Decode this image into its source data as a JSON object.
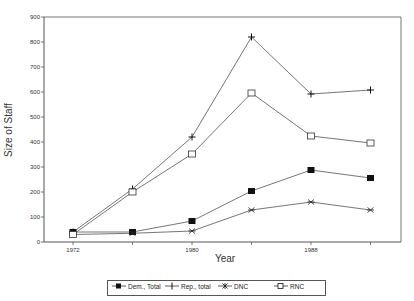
{
  "chart_data": {
    "type": "line",
    "title": "",
    "xlabel": "Year",
    "ylabel": "Size of Staff",
    "x": [
      1972,
      1976,
      1980,
      1984,
      1988,
      1992
    ],
    "x_tick_labels": [
      "1972",
      "",
      "1980",
      "",
      "1988",
      ""
    ],
    "y_ticks": [
      0,
      100,
      200,
      300,
      400,
      500,
      600,
      700,
      800,
      900
    ],
    "ylim": [
      0,
      900
    ],
    "grid": false,
    "legend_position": "bottom",
    "series": [
      {
        "name": "Dem., Total",
        "marker": "filled-square",
        "values": [
          40,
          40,
          84,
          204,
          288,
          256
        ]
      },
      {
        "name": "Rep., total",
        "marker": "plus",
        "values": [
          40,
          212,
          420,
          820,
          592,
          608
        ]
      },
      {
        "name": "DNC",
        "marker": "asterisk",
        "values": [
          30,
          35,
          44,
          128,
          160,
          128
        ]
      },
      {
        "name": "RNC",
        "marker": "open-square",
        "values": [
          30,
          200,
          352,
          596,
          424,
          396
        ]
      }
    ]
  },
  "legend": {
    "items": [
      {
        "label": "Dem., Total"
      },
      {
        "label": "Rep., total"
      },
      {
        "label": "DNC"
      },
      {
        "label": "RNC"
      }
    ]
  }
}
